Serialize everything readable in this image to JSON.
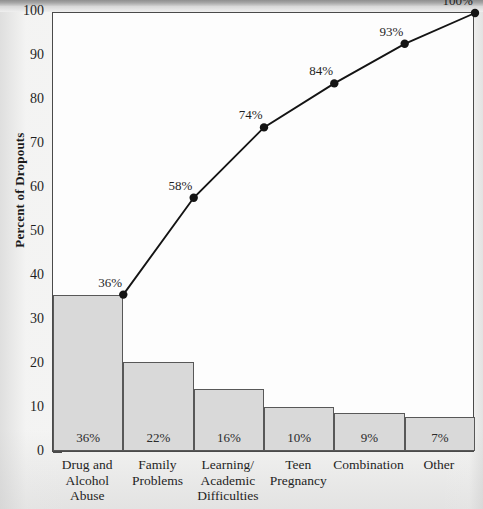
{
  "chart_data": {
    "type": "bar",
    "title": "",
    "xlabel": "",
    "ylabel": "Percent of Dropouts",
    "ylim": [
      0,
      100
    ],
    "yticks": [
      0,
      10,
      20,
      30,
      40,
      50,
      60,
      70,
      80,
      90,
      100
    ],
    "grid": false,
    "legend": "none",
    "categories": [
      "Drug and Alcohol Abuse",
      "Family Problems",
      "Learning/ Academic Difficulties",
      "Teen Pregnancy",
      "Combination",
      "Other"
    ],
    "category_lines": [
      [
        "Drug and",
        "Alcohol",
        "Abuse"
      ],
      [
        "Family",
        "Problems"
      ],
      [
        "Learning/",
        "Academic",
        "Difficulties"
      ],
      [
        "Teen",
        "Pregnancy"
      ],
      [
        "Combination"
      ],
      [
        "Other"
      ]
    ],
    "values": [
      36,
      22,
      16,
      10,
      9,
      7
    ],
    "bar_heights_plotted": [
      35.5,
      20.3,
      14.0,
      10.0,
      8.7,
      7.8
    ],
    "bar_value_labels": [
      "36%",
      "22%",
      "16%",
      "10%",
      "9%",
      "7%"
    ],
    "series": [
      {
        "name": "Percent of Dropouts",
        "type": "bar",
        "values": [
          36,
          22,
          16,
          10,
          9,
          7
        ]
      },
      {
        "name": "Cumulative Percent",
        "type": "line",
        "values": [
          36,
          58,
          74,
          84,
          93,
          100
        ],
        "point_labels": [
          "36%",
          "58%",
          "74%",
          "84%",
          "93%",
          "100%"
        ],
        "marker": "filled-circle"
      }
    ]
  },
  "colors": {
    "bar_fill": "#d9d9d9",
    "bar_stroke": "#585858",
    "line": "#141414",
    "axis": "#4a4a4a",
    "text": "#1f1f1f",
    "plot_background": "#fdfdfd",
    "page_background": "#f4f4f3"
  }
}
